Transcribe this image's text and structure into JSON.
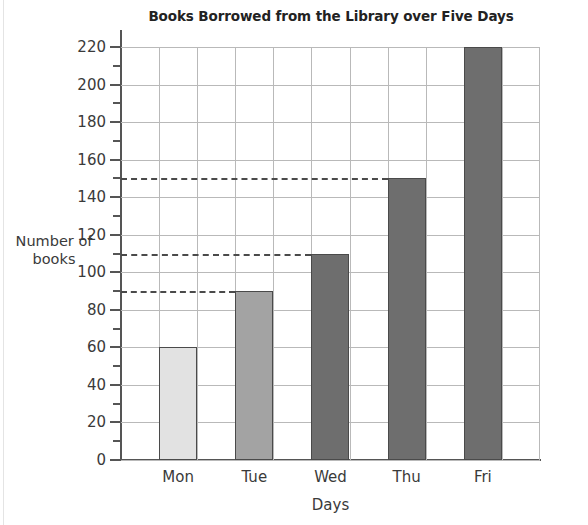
{
  "chart_data": {
    "type": "bar",
    "title": "Books Borrowed from the Library over Five Days",
    "xlabel": "Days",
    "ylabel_line1": "Number of",
    "ylabel_line2": "books",
    "ylabel": "Number of books",
    "categories": [
      "Mon",
      "Tue",
      "Wed",
      "Thu",
      "Fri"
    ],
    "values": [
      60,
      90,
      110,
      150,
      220
    ],
    "bar_colors": [
      "#e2e2e2",
      "#a3a3a3",
      "#6e6e6e",
      "#6e6e6e",
      "#6e6e6e"
    ],
    "bar_border_color": "#4a4a4a",
    "ylim": [
      0,
      220
    ],
    "y_major_step": 20,
    "y_minor_step": 10,
    "y_tick_labels": [
      "0",
      "20",
      "40",
      "60",
      "80",
      "100",
      "120",
      "140",
      "160",
      "180",
      "200",
      "220"
    ],
    "grid": true,
    "grid_color": "#b9b9b9",
    "legend": null,
    "annotations": [
      {
        "type": "dashed-guide",
        "y": 150,
        "to_category": "Thu"
      },
      {
        "type": "dashed-guide",
        "y": 110,
        "to_category": "Wed"
      },
      {
        "type": "dashed-guide",
        "y": 90,
        "to_category": "Tue"
      }
    ]
  }
}
